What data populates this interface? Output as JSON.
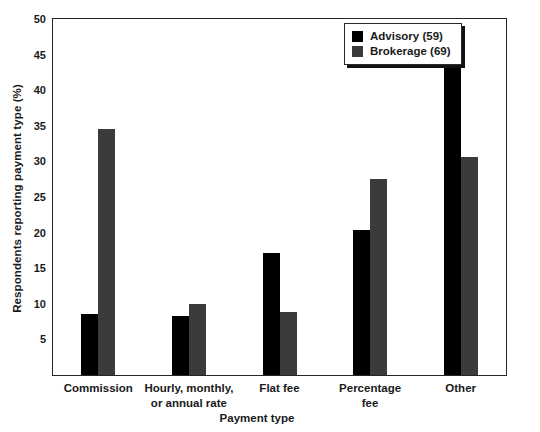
{
  "chart_data": {
    "type": "bar",
    "title": "",
    "xlabel": "Payment type",
    "ylabel": "Respondents reporting payment type (%)",
    "categories": [
      "Commission",
      "Hourly, monthly,\nor annual rate",
      "Flat fee",
      "Percentage\nfee",
      "Other"
    ],
    "category_lines": [
      [
        "Commission"
      ],
      [
        "Hourly, monthly,",
        "or annual rate"
      ],
      [
        "Flat fee"
      ],
      [
        "Percentage",
        "fee"
      ],
      [
        "Other"
      ]
    ],
    "series": [
      {
        "name": "Advisory (59)",
        "short_name": "Advisory",
        "n": 59,
        "color": "#000000",
        "values": [
          8.6,
          8.3,
          17.2,
          20.3,
          47.5
        ]
      },
      {
        "name": "Brokerage (69)",
        "short_name": "Brokerage",
        "n": 69,
        "color": "#3b3b3b",
        "values": [
          34.6,
          10.0,
          8.9,
          27.5,
          30.6
        ]
      }
    ],
    "ylim": [
      0,
      50
    ],
    "yticks": [
      5,
      10,
      15,
      20,
      25,
      30,
      35,
      40,
      45,
      50
    ],
    "ytick_labels": [
      "5",
      "10",
      "15",
      "20",
      "25",
      "30",
      "35",
      "40",
      "45",
      "50"
    ],
    "grid": false,
    "legend_position": "top-right",
    "frame": true
  },
  "legend": {
    "entries": [
      {
        "label": "Advisory (59)",
        "color": "#000000"
      },
      {
        "label": "Brokerage (69)",
        "color": "#3b3b3b"
      }
    ]
  },
  "colors": {
    "advisory": "#000000",
    "brokerage": "#3b3b3b",
    "axis": "#262626",
    "background": "#ffffff"
  }
}
